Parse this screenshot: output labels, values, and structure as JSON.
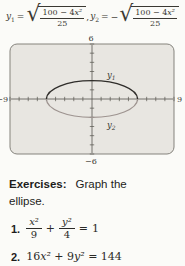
{
  "formulas": {
    "radical": "√",
    "separator": ",",
    "y1": {
      "base": "y",
      "sub": "1",
      "eq": "=",
      "sign": "",
      "num_coef": "100 − 4",
      "num_var": "x²",
      "den": "25"
    },
    "y2": {
      "base": "y",
      "sub": "2",
      "eq": "=",
      "sign": "−",
      "num_coef": "100 − 4",
      "num_var": "x²",
      "den": "25"
    }
  },
  "graph": {
    "ymax_label": "6",
    "ymin_label": "−6",
    "xmin_label": "−9",
    "xmax_label": "9",
    "upper_curve_label": {
      "base": "y",
      "sub": "1"
    },
    "lower_curve_label": {
      "base": "y",
      "sub": "2"
    },
    "window": {
      "xmin": -9,
      "xmax": 9,
      "ymin": -6,
      "ymax": 6
    },
    "ellipse": {
      "rx": 5,
      "ry": 2
    },
    "colors": {
      "screen_bg": "#e8e6e1",
      "screen_border": "#85837d",
      "axis": "#56544e",
      "upper_curve": "#2f2d2a",
      "lower_curve": "#9e9490"
    }
  },
  "exercises": {
    "heading": "Exercises:",
    "instruction": "Graph the ellipse.",
    "item1": {
      "number": "1.",
      "f1_num": "x²",
      "f1_den": "9",
      "plus": "+",
      "f2_num": "y²",
      "f2_den": "4",
      "equals": "=",
      "rhs": "1"
    },
    "item2": {
      "number": "2.",
      "c1": "16",
      "v1": "x²",
      "c2": " + 9",
      "v2": "y²",
      "c3": " = 144"
    }
  }
}
